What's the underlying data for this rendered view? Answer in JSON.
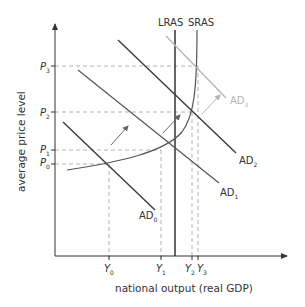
{
  "diagram": {
    "type": "AD-AS macroeconomic diagram",
    "y_axis_label": "average price level",
    "x_axis_label": "national output (real GDP)",
    "curves": {
      "lras": {
        "label": "LRAS"
      },
      "sras": {
        "label": "SRAS"
      },
      "ad0": {
        "label": "AD",
        "sub": "0"
      },
      "ad1": {
        "label": "AD",
        "sub": "1"
      },
      "ad2": {
        "label": "AD",
        "sub": "2"
      },
      "ad3": {
        "label": "AD",
        "sub": "3"
      }
    },
    "price_levels": [
      {
        "label": "P",
        "sub": "3"
      },
      {
        "label": "P",
        "sub": "2"
      },
      {
        "label": "P",
        "sub": "1"
      },
      {
        "label": "P",
        "sub": "0"
      }
    ],
    "output_levels": [
      {
        "label": "Y",
        "sub": "0"
      },
      {
        "label": "Y",
        "sub": "1"
      },
      {
        "label": "Y",
        "sub": "2"
      },
      {
        "label": "Y",
        "sub": "3"
      }
    ],
    "colors": {
      "axis": "#333333",
      "curve_dark": "#3a3a3a",
      "curve_mid": "#555555",
      "curve_light": "#b5b5b5",
      "dashed": "#9a9a9a",
      "arrow": "#666666"
    }
  }
}
